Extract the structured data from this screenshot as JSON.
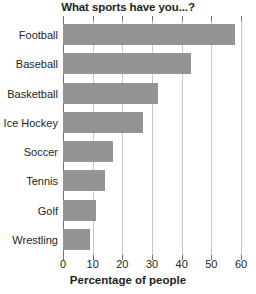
{
  "chart_data": {
    "type": "bar",
    "orientation": "horizontal",
    "title": "What sports have you...?",
    "xlabel": "Percentage of people",
    "ylabel": "",
    "categories": [
      "Football",
      "Baseball",
      "Basketball",
      "Ice Hockey",
      "Soccer",
      "Tennis",
      "Golf",
      "Wrestling"
    ],
    "values": [
      58,
      43,
      32,
      27,
      17,
      14,
      11,
      9
    ],
    "xlim": [
      0,
      60
    ],
    "xticks": [
      0,
      10,
      20,
      30,
      40,
      50,
      60
    ],
    "xtick_labels": [
      "0",
      "10",
      "20",
      "30",
      "40",
      "50",
      "60"
    ],
    "grid": true,
    "grid_axis": "x",
    "legend": false,
    "bar_color": "#949494",
    "grid_color": "#c8c8c8",
    "axis_color": "#6f6f6f",
    "text_color": "#231f20"
  }
}
